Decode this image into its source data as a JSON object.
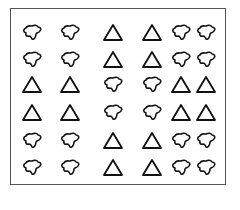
{
  "figure": {
    "rows": 6,
    "cols": 6,
    "stroke_color": "#111111",
    "frame_color": "#555555",
    "col_x": [
      32,
      70,
      113,
      152,
      181,
      206
    ],
    "row_y": [
      33,
      60,
      85,
      113,
      141,
      168
    ],
    "grid": [
      [
        "blob",
        "blob",
        "triangle",
        "triangle",
        "blob",
        "blob"
      ],
      [
        "blob",
        "blob",
        "triangle",
        "triangle",
        "blob",
        "blob"
      ],
      [
        "triangle",
        "triangle",
        "blob",
        "blob",
        "triangle",
        "triangle"
      ],
      [
        "triangle",
        "triangle",
        "blob",
        "blob",
        "triangle",
        "triangle"
      ],
      [
        "blob",
        "blob",
        "triangle",
        "triangle",
        "blob",
        "blob"
      ],
      [
        "blob",
        "blob",
        "triangle",
        "triangle",
        "blob",
        "blob"
      ]
    ]
  }
}
